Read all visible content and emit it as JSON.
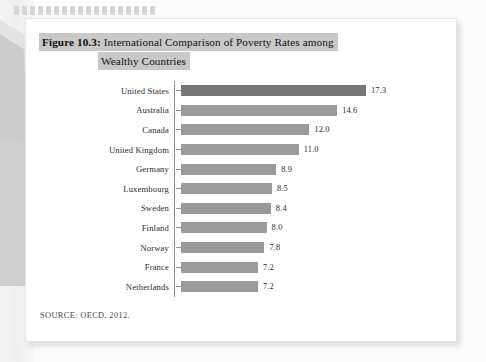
{
  "page": {
    "title_prefix": "Figure 10.3:",
    "title_line1": " International Comparison of Poverty Rates among",
    "title_line2": "Wealthy Countries",
    "source": "SOURCE: OECD, 2012."
  },
  "colors": {
    "bar": "#9a9a9a",
    "bar_highlight": "#767676",
    "title_highlight": "#c8c8c8",
    "axis": "#8e8e8e",
    "page": "#ffffff",
    "background": "#fcfcfc"
  },
  "chart_data": {
    "type": "bar",
    "orientation": "horizontal",
    "title": "Figure 10.3: International Comparison of Poverty Rates among Wealthy Countries",
    "xlabel": "",
    "ylabel": "",
    "xlim": [
      0,
      17.3
    ],
    "grid": false,
    "legend": false,
    "data_labels": true,
    "source": "SOURCE: OECD, 2012.",
    "categories": [
      "United States",
      "Australia",
      "Canada",
      "United Kingdom",
      "Germany",
      "Luxembourg",
      "Sweden",
      "Finland",
      "Norway",
      "France",
      "Netherlands"
    ],
    "values": [
      17.3,
      14.6,
      12.0,
      11.0,
      8.9,
      8.5,
      8.4,
      8.0,
      7.8,
      7.2,
      7.2
    ],
    "value_labels": [
      "17.3",
      "14.6",
      "12.0",
      "11.0",
      "8.9",
      "8.5",
      "8.4",
      "8.0",
      "7.8",
      "7.2",
      "7.2"
    ],
    "highlight_index": 0
  }
}
